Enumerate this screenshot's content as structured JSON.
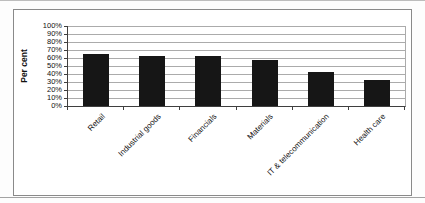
{
  "chart_data": {
    "type": "bar",
    "categories": [
      "Retail",
      "Industrial goods",
      "Financials",
      "Materials",
      "IT & telecommunication",
      "Health care"
    ],
    "values": [
      65,
      63,
      62,
      57,
      42,
      32
    ],
    "title": "",
    "xlabel": "",
    "ylabel": "Per cent",
    "ylim": [
      0,
      100
    ],
    "ytick_step": 10,
    "ytick_suffix": "%",
    "grid": true,
    "legend": "none",
    "bar_color": "#161616",
    "gridline_color": "#ababab",
    "axis_color": "#3f3f3f",
    "frame_color": "#8a8a8a"
  }
}
